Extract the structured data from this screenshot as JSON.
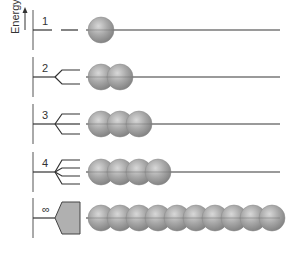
{
  "axis": {
    "label": "Energy"
  },
  "rows": [
    {
      "label": "1",
      "atoms": 1
    },
    {
      "label": "2",
      "atoms": 2
    },
    {
      "label": "3",
      "atoms": 3
    },
    {
      "label": "4",
      "atoms": 4
    },
    {
      "label": "∞",
      "atoms": 10
    }
  ],
  "colors": {
    "sphere": "#9a9a9a",
    "line": "#444444",
    "band": "#b0b0b0"
  }
}
